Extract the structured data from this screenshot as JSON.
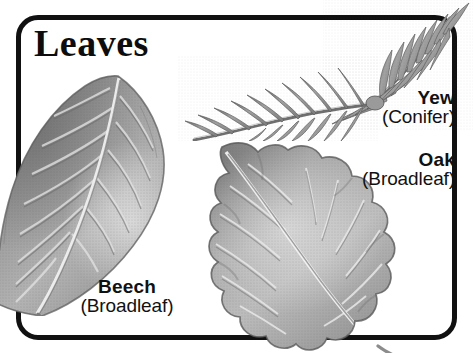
{
  "page": {
    "title": "Leaves",
    "background_color": "#ffffff",
    "frame_color": "#111111",
    "width": 473,
    "height": 353
  },
  "specimens": [
    {
      "id": "beech",
      "name": "Beech",
      "kind": "(Broadleaf)",
      "illustration": "beech-leaf-illustration",
      "tone": "#9a9a9a"
    },
    {
      "id": "yew",
      "name": "Yew",
      "kind": "(Conifer)",
      "illustration": "yew-conifer-branch-illustration",
      "tone": "#8f8f8f"
    },
    {
      "id": "oak",
      "name": "Oak",
      "kind": "(Broadleaf)",
      "illustration": "oak-leaf-illustration",
      "tone": "#9e9e9e"
    }
  ]
}
